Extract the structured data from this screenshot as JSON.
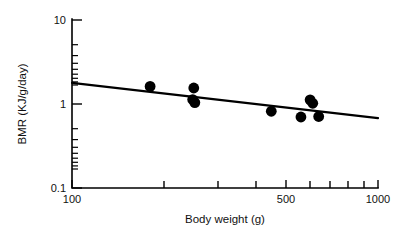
{
  "chart_data": {
    "type": "scatter",
    "title": "",
    "xlabel": "Body weight (g)",
    "ylabel": "BMR (KJ/g/day)",
    "xscale": "log",
    "yscale": "log",
    "xlim": [
      100,
      1000
    ],
    "ylim": [
      0.1,
      10
    ],
    "grid": false,
    "legend": null,
    "x_tick_labels": [
      "100",
      "500",
      "1000"
    ],
    "x_tick_values": [
      100,
      500,
      1000
    ],
    "x_minor_ticks": [
      200,
      300,
      400,
      600,
      700,
      800,
      900
    ],
    "y_tick_labels": [
      "10",
      "1",
      "0.1"
    ],
    "y_tick_values": [
      10,
      1,
      0.1
    ],
    "y_minor_ticks": [
      0.2,
      0.3,
      0.4,
      0.5,
      0.6,
      0.7,
      0.8,
      0.9,
      2,
      3,
      4,
      5,
      6,
      7,
      8,
      9
    ],
    "points": [
      {
        "x": 180,
        "y": 1.62
      },
      {
        "x": 250,
        "y": 1.55
      },
      {
        "x": 248,
        "y": 1.13
      },
      {
        "x": 252,
        "y": 1.04
      },
      {
        "x": 448,
        "y": 0.82
      },
      {
        "x": 560,
        "y": 0.7
      },
      {
        "x": 600,
        "y": 1.12
      },
      {
        "x": 612,
        "y": 1.02
      },
      {
        "x": 640,
        "y": 0.71
      }
    ],
    "fit_line": {
      "x_start": 100,
      "y_start": 1.78,
      "x_end": 1000,
      "y_end": 0.68,
      "style": "solid"
    }
  },
  "axes": {
    "y_label_text": "BMR (KJ/g/day)",
    "x_label_text": "Body weight (g)"
  },
  "colors": {
    "ink": "#000000",
    "background": "#ffffff"
  }
}
